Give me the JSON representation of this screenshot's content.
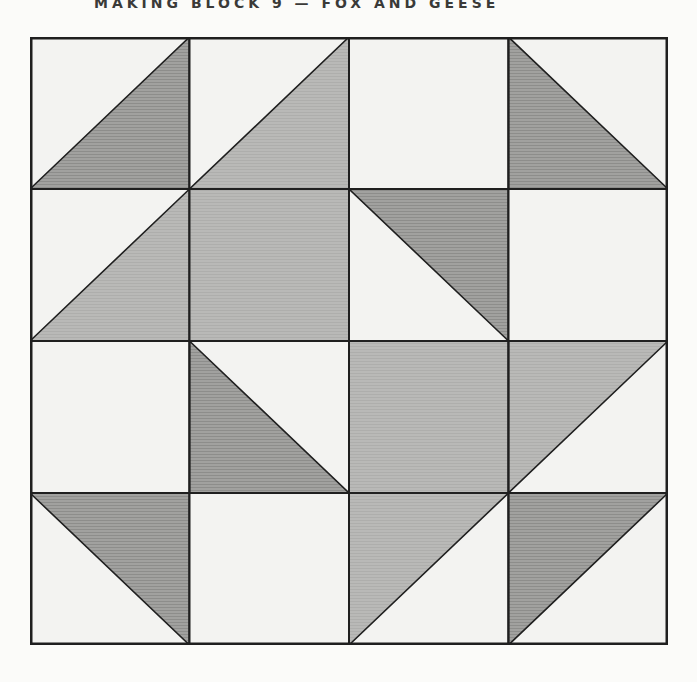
{
  "page": {
    "title": "MAKING BLOCK 9 — FOX AND GEESE",
    "background": "#fbfbf9"
  },
  "palette": {
    "dark": "#9a9a98",
    "dark_hatch": "#8d8d8b",
    "dark_base": "#a1a19f",
    "medium": "#b6b6b4",
    "medium_hatch": "#aeaeac",
    "medium_base": "#b9b9b7",
    "white": "#f3f3f1",
    "grid_line": "#1f1f1f",
    "title_color": "#3a3a38"
  },
  "block": {
    "name": "fox-and-geese-quilt-block",
    "cols": 4,
    "rows": 4,
    "width": 638,
    "height": 608,
    "legend": {
      "corner": "location of the triangle's right angle; triangle fills the half of the cell adjacent to that corner",
      "base": "background fill of the full cell",
      "colors": [
        "dark",
        "medium",
        "white"
      ]
    },
    "cells": [
      {
        "r": 0,
        "c": 0,
        "base": "white",
        "tri": {
          "corner": "br",
          "color": "dark"
        }
      },
      {
        "r": 0,
        "c": 1,
        "base": "white",
        "tri": {
          "corner": "br",
          "color": "medium"
        }
      },
      {
        "r": 0,
        "c": 2,
        "base": "white",
        "tri": null
      },
      {
        "r": 0,
        "c": 3,
        "base": "white",
        "tri": {
          "corner": "bl",
          "color": "dark"
        }
      },
      {
        "r": 1,
        "c": 0,
        "base": "white",
        "tri": {
          "corner": "br",
          "color": "medium"
        }
      },
      {
        "r": 1,
        "c": 1,
        "base": "medium",
        "tri": null
      },
      {
        "r": 1,
        "c": 2,
        "base": "white",
        "tri": {
          "corner": "tr",
          "color": "dark"
        }
      },
      {
        "r": 1,
        "c": 3,
        "base": "white",
        "tri": null
      },
      {
        "r": 2,
        "c": 0,
        "base": "white",
        "tri": null
      },
      {
        "r": 2,
        "c": 1,
        "base": "white",
        "tri": {
          "corner": "bl",
          "color": "dark"
        }
      },
      {
        "r": 2,
        "c": 2,
        "base": "medium",
        "tri": null
      },
      {
        "r": 2,
        "c": 3,
        "base": "white",
        "tri": {
          "corner": "tl",
          "color": "medium"
        }
      },
      {
        "r": 3,
        "c": 0,
        "base": "white",
        "tri": {
          "corner": "tr",
          "color": "dark"
        }
      },
      {
        "r": 3,
        "c": 1,
        "base": "white",
        "tri": null
      },
      {
        "r": 3,
        "c": 2,
        "base": "white",
        "tri": {
          "corner": "tl",
          "color": "medium"
        }
      },
      {
        "r": 3,
        "c": 3,
        "base": "white",
        "tri": {
          "corner": "tl",
          "color": "dark"
        }
      }
    ]
  }
}
